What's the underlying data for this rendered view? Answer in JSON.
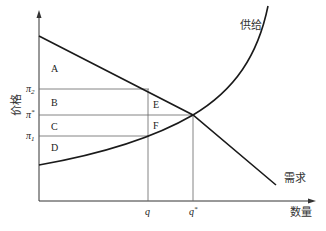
{
  "diagram": {
    "type": "supply-demand",
    "axes": {
      "y_label": "价格",
      "x_label": "数量"
    },
    "curves": {
      "supply_label": "供给",
      "demand_label": "需求"
    },
    "price_ticks": {
      "pi2": "π",
      "pi2_sub": "2",
      "pistar": "π",
      "pistar_sup": "*",
      "pi1": "π",
      "pi1_sub": "1"
    },
    "quantity_ticks": {
      "q": "q",
      "qstar": "q",
      "qstar_sup": "*"
    },
    "regions": {
      "A": "A",
      "B": "B",
      "C": "C",
      "D": "D",
      "E": "E",
      "F": "F"
    },
    "colors": {
      "curve": "#1a1a1a",
      "guide": "#555555",
      "axis": "#333333"
    }
  }
}
